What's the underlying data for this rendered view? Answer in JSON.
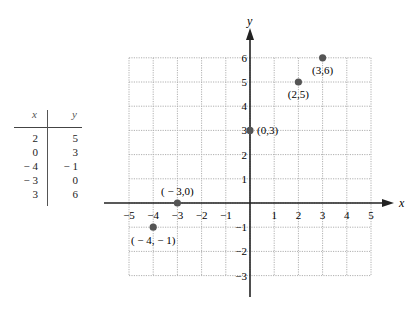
{
  "chart_data": {
    "type": "scatter",
    "title": "",
    "xlabel": "x",
    "ylabel": "y",
    "xlim": [
      -5,
      5
    ],
    "ylim": [
      -3,
      6
    ],
    "grid": true,
    "x_ticks": [
      "−5",
      "−4",
      "−3",
      "−2",
      "−1",
      "1",
      "2",
      "3",
      "4",
      "5"
    ],
    "y_ticks": [
      "6",
      "5",
      "4",
      "3",
      "2",
      "1",
      "−1",
      "−2",
      "−3"
    ],
    "points": [
      {
        "x": 2,
        "y": 5,
        "label": "(2,5)"
      },
      {
        "x": 0,
        "y": 3,
        "label": "(0,3)"
      },
      {
        "x": -4,
        "y": -1,
        "label": "( − 4, − 1)"
      },
      {
        "x": -3,
        "y": 0,
        "label": "( − 3,0)"
      },
      {
        "x": 3,
        "y": 6,
        "label": "(3,6)"
      }
    ],
    "colors": {
      "point": "#555555",
      "axis": "#222222",
      "grid": "#b0b0b0"
    }
  },
  "table": {
    "headers": {
      "x": "x",
      "y": "y"
    },
    "rows": [
      {
        "x": "2",
        "y": "5"
      },
      {
        "x": "0",
        "y": "3"
      },
      {
        "x": "− 4",
        "y": "− 1"
      },
      {
        "x": "− 3",
        "y": "0"
      },
      {
        "x": "3",
        "y": "6"
      }
    ]
  }
}
